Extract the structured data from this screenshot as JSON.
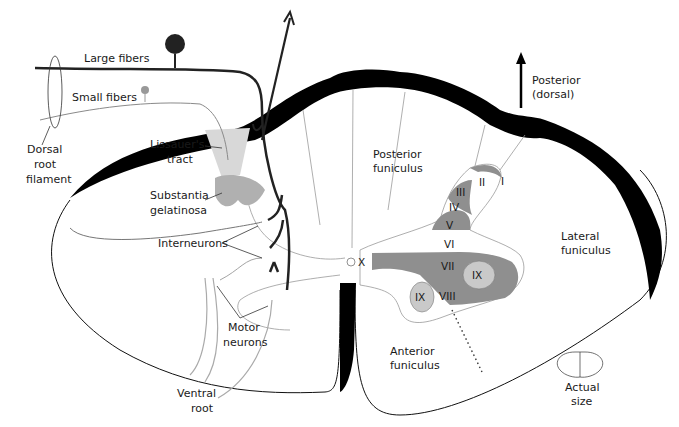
{
  "colors": {
    "outline": "#111111",
    "pia": "#000000",
    "lamina_dark": "#8f8f8f",
    "lamina_light": "#c9c9c9",
    "substantia": "#b0b0b0",
    "lissauer": "#d8d8d8",
    "thin_line": "#9a9a9a",
    "small_fiber": "#8a8a8a"
  },
  "labels": {
    "large_fibers": "Large fibers",
    "small_fibers": "Small fibers",
    "dorsal_root_filament": [
      "Dorsal",
      "root",
      "filament"
    ],
    "lissauers_tract": [
      "Lissauer's",
      "tract"
    ],
    "substantia_gelatinosa": [
      "Substantia",
      "gelatinosa"
    ],
    "interneurons": "Interneurons",
    "motor_neurons": [
      "Motor",
      "neurons"
    ],
    "ventral_root": [
      "Ventral",
      "root"
    ],
    "posterior_funiculus": [
      "Posterior",
      "funiculus"
    ],
    "posterior_dorsal": [
      "Posterior",
      "(dorsal)"
    ],
    "lateral_funiculus": [
      "Lateral",
      "funiculus"
    ],
    "anterior_funiculus": [
      "Anterior",
      "funiculus"
    ],
    "actual_size": [
      "Actual",
      "size"
    ]
  },
  "laminae": [
    "I",
    "II",
    "III",
    "IV",
    "V",
    "VI",
    "VII",
    "VIII",
    "IX",
    "IX",
    "X"
  ]
}
